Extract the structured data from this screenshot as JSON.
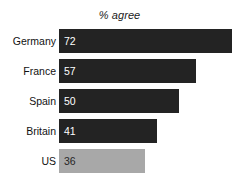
{
  "chart_data": {
    "type": "bar",
    "orientation": "horizontal",
    "title": "% agree",
    "xlabel": "",
    "ylabel": "",
    "categories": [
      "Germany",
      "France",
      "Spain",
      "Britain",
      "US"
    ],
    "values": [
      72,
      57,
      50,
      41,
      36
    ],
    "value_labels": [
      "72",
      "57",
      "50",
      "41",
      "36"
    ],
    "xlim": [
      0,
      100
    ],
    "grid": false,
    "legend": "none",
    "bar_colors": [
      "#232323",
      "#232323",
      "#232323",
      "#232323",
      "#a8a8a8"
    ],
    "highlight_category": "US",
    "series": [
      {
        "name": "% agree",
        "values": [
          72,
          57,
          50,
          41,
          36
        ]
      }
    ]
  },
  "colors": {
    "bar_dark": "#232323",
    "bar_light": "#a8a8a8",
    "value_on_dark": "#ffffff",
    "value_on_light": "#262626",
    "background": "#ffffff",
    "label_text": "#111111"
  }
}
